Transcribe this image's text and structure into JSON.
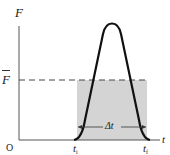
{
  "diagram": {
    "type": "force-time impulse graph",
    "axes": {
      "y_label": "F",
      "x_label": "t",
      "origin_label": "O"
    },
    "average_force_label": "F",
    "average_force_has_bar": true,
    "time_labels": {
      "start": {
        "main": "t",
        "sub": "i"
      },
      "end": {
        "main": "t",
        "sub": "f"
      }
    },
    "interval_label": "Δt",
    "colors": {
      "curve": "#111111",
      "axes": "#555555",
      "shaded_region": "#d4d4d4",
      "dashed_line": "#444444"
    }
  }
}
